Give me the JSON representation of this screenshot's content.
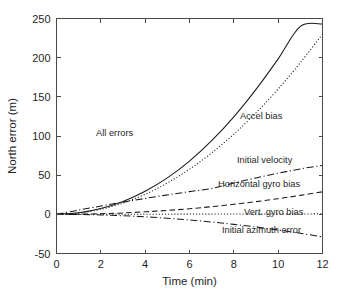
{
  "figure": {
    "background_color": "#ffffff",
    "line_color": "#1a1a1a",
    "axis_color": "#4a4a4a"
  },
  "chart_data": {
    "type": "line",
    "title": "",
    "xlabel": "Time (min)",
    "ylabel": "North error (m)",
    "xlim": [
      0,
      12
    ],
    "ylim": [
      -50,
      250
    ],
    "xticks": [
      0,
      2,
      4,
      6,
      8,
      10,
      12
    ],
    "yticks": [
      -50,
      0,
      50,
      100,
      150,
      200,
      250
    ],
    "xtick_labels": [
      "0",
      "2",
      "4",
      "6",
      "8",
      "10",
      "12"
    ],
    "ytick_labels": [
      "-50",
      "0",
      "50",
      "100",
      "150",
      "200",
      "250"
    ],
    "grid": false,
    "legend": "in-plot annotations",
    "x": [
      0,
      1,
      2,
      3,
      4,
      5,
      6,
      7,
      8,
      9,
      10,
      11,
      12
    ],
    "series": [
      {
        "name": "All errors",
        "linestyle": "solid",
        "values": [
          0,
          2.0,
          7.5,
          16.5,
          29.5,
          46.5,
          68.0,
          94.0,
          124.5,
          159.5,
          198.5,
          240.0,
          243.0
        ]
      },
      {
        "name": "Accel bias",
        "linestyle": "dotted",
        "values": [
          0,
          1.6,
          6.4,
          14.4,
          25.6,
          40.0,
          57.6,
          78.4,
          102.4,
          129.6,
          160.0,
          193.6,
          230.0
        ]
      },
      {
        "name": "Initial velocity",
        "linestyle": "dashdot",
        "values": [
          0,
          5.4,
          10.6,
          15.6,
          20.3,
          24.8,
          29.0,
          33.0,
          40.0,
          46.5,
          52.5,
          58.0,
          62.5
        ]
      },
      {
        "name": "Horizontal gyro bias",
        "linestyle": "dashed",
        "values": [
          0,
          0.2,
          0.8,
          1.8,
          3.2,
          5.0,
          7.2,
          9.8,
          12.8,
          16.2,
          20.0,
          24.2,
          28.8
        ]
      },
      {
        "name": "Vert. gyro bias",
        "linestyle": "dotted",
        "values": [
          0,
          0.0,
          0.1,
          0.1,
          0.2,
          0.2,
          0.3,
          0.3,
          0.4,
          0.4,
          0.5,
          0.5,
          0.6
        ]
      },
      {
        "name": "Initial azimuth error",
        "linestyle": "dashdot",
        "values": [
          0,
          -0.2,
          -0.8,
          -1.8,
          -3.2,
          -5.0,
          -7.2,
          -9.8,
          -12.8,
          -16.2,
          -20.0,
          -24.2,
          -28.8
        ]
      }
    ],
    "annotations": [
      {
        "text": "All errors",
        "x_px": 96,
        "y_px": 136
      },
      {
        "text": "Accel bias",
        "x_px": 240,
        "y_px": 119
      },
      {
        "text": "Initial velocity",
        "x_px": 237,
        "y_px": 163
      },
      {
        "text": "Horizontal gyro bias",
        "x_px": 218,
        "y_px": 187
      },
      {
        "text": "Vert. gyro bias",
        "x_px": 244,
        "y_px": 215
      },
      {
        "text": "Initial azimuth error",
        "x_px": 222,
        "y_px": 233
      }
    ]
  }
}
